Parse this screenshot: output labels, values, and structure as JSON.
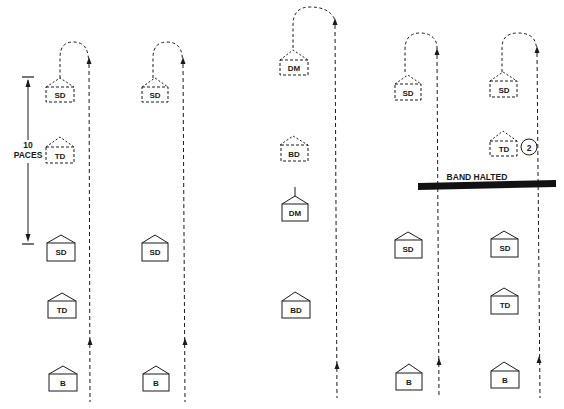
{
  "diagram": {
    "colors": {
      "ink": "#1a1a1a",
      "background": "#ffffff"
    },
    "measure": {
      "line1": "10",
      "line2": "PACES"
    },
    "halt_bar": {
      "label": "BAND HALTED"
    },
    "circle_marker": {
      "label": "2"
    },
    "columns": [
      {
        "ghost": [
          {
            "label": "SD"
          },
          {
            "label": "TD"
          }
        ],
        "solid": [
          {
            "label": "SD"
          },
          {
            "label": "TD"
          },
          {
            "label": "B"
          }
        ]
      },
      {
        "ghost": [
          {
            "label": "SD"
          }
        ],
        "solid": [
          {
            "label": "SD"
          },
          {
            "label": "B"
          }
        ]
      },
      {
        "ghost": [
          {
            "label": "DM"
          },
          {
            "label": "BD"
          }
        ],
        "solid": [
          {
            "label": "DM"
          },
          {
            "label": "BD"
          }
        ]
      },
      {
        "ghost": [
          {
            "label": "SD"
          }
        ],
        "solid": [
          {
            "label": "SD"
          },
          {
            "label": "B"
          }
        ]
      },
      {
        "ghost": [
          {
            "label": "SD"
          },
          {
            "label": "TD"
          }
        ],
        "solid": [
          {
            "label": "SD"
          },
          {
            "label": "TD"
          },
          {
            "label": "B"
          }
        ]
      }
    ]
  }
}
